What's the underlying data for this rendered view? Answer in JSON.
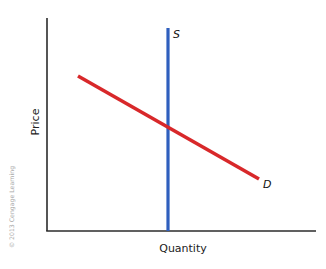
{
  "chart_data": {
    "type": "line",
    "title": "",
    "xlabel": "Quantity",
    "ylabel": "Price",
    "grid": false,
    "legend": "none",
    "axis_ticks": "none",
    "series": [
      {
        "name": "S",
        "label": "S",
        "color": "#2f5fbe",
        "description": "Vertical (perfectly inelastic) supply curve",
        "points_px": [
          [
            168,
            28
          ],
          [
            168,
            231
          ]
        ]
      },
      {
        "name": "D",
        "label": "D",
        "color": "#d8282a",
        "description": "Downward-sloping demand curve",
        "points_px": [
          [
            78,
            76
          ],
          [
            259,
            179
          ]
        ]
      }
    ],
    "annotations": [
      {
        "text": "S",
        "at": "top of supply curve"
      },
      {
        "text": "D",
        "at": "right end of demand curve"
      }
    ],
    "equilibrium_px": [
      168,
      127
    ],
    "axes_px": {
      "origin": [
        47,
        231
      ],
      "y_top": 18,
      "x_right": 316
    }
  },
  "labels": {
    "supply": "S",
    "demand": "D",
    "x_axis": "Quantity",
    "y_axis": "Price",
    "copyright": "© 2013 Cengage Learning"
  }
}
